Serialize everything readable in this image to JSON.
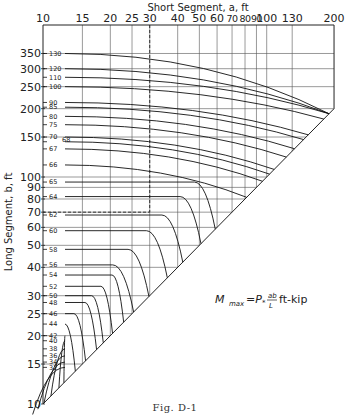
{
  "chart_data": {
    "type": "line",
    "title": "Short Segment, a, ft",
    "xlabel": "Short Segment, a, ft",
    "ylabel": "Long Segment, b, ft",
    "x_scale": "log",
    "y_scale": "log",
    "x_ticks": [
      10,
      15,
      20,
      25,
      30,
      40,
      50,
      60,
      70,
      80,
      90,
      100,
      130,
      200
    ],
    "y_ticks": [
      10,
      15,
      20,
      25,
      30,
      40,
      50,
      60,
      70,
      80,
      90,
      100,
      150,
      200,
      250,
      300,
      350
    ],
    "xlim": [
      10,
      200
    ],
    "ylim": [
      10,
      450
    ],
    "grid": true,
    "reference_lines": [
      {
        "type": "dashed-vertical",
        "a": 30
      },
      {
        "type": "dashed-horizontal",
        "b": 70
      }
    ],
    "boundary": "diagonal a = b",
    "series_label": "Contours of P* (constant moment factor)",
    "series": [
      {
        "name": "130",
        "b_at_left": 350
      },
      {
        "name": "120",
        "b_at_left": 300
      },
      {
        "name": "110",
        "b_at_left": 275
      },
      {
        "name": "100",
        "b_at_left": 250
      },
      {
        "name": "90",
        "b_at_left": 213
      },
      {
        "name": "85",
        "b_at_left": 203
      },
      {
        "name": "80",
        "b_at_left": 185
      },
      {
        "name": "75",
        "b_at_left": 170
      },
      {
        "name": "70",
        "b_at_left": 150
      },
      {
        "name": "68",
        "b_at_left": 143
      },
      {
        "name": "67",
        "b_at_left": 133
      },
      {
        "name": "66",
        "b_at_left": 113
      },
      {
        "name": "65",
        "b_at_left": 95
      },
      {
        "name": "64",
        "b_at_left": 82
      },
      {
        "name": "62",
        "b_at_left": 68
      },
      {
        "name": "60",
        "b_at_left": 58
      },
      {
        "name": "58",
        "b_at_left": 48
      },
      {
        "name": "56",
        "b_at_left": 41
      },
      {
        "name": "54",
        "b_at_left": 37
      },
      {
        "name": "52",
        "b_at_left": 33
      },
      {
        "name": "50",
        "b_at_left": 30
      },
      {
        "name": "48",
        "b_at_left": 28
      },
      {
        "name": "46",
        "b_at_left": 25
      },
      {
        "name": "44",
        "b_at_left": 22.5
      },
      {
        "name": "42",
        "b_at_left": 20
      },
      {
        "name": "40",
        "b_at_left": 19
      },
      {
        "name": "38",
        "b_at_left": 17.5
      },
      {
        "name": "36",
        "b_at_left": 16.3
      },
      {
        "name": "34",
        "b_at_left": 15.3
      },
      {
        "name": "32",
        "b_at_left": 14.5
      }
    ],
    "annotation": "M_max = P* ab/L ft-kip",
    "caption": "Fig. D-1"
  },
  "labels": {
    "x_title": "Short Segment, a, ft",
    "y_title": "Long Segment, b, ft",
    "formula_m": "M",
    "formula_sub": "max",
    "formula_eq": "=P",
    "formula_star": "*",
    "formula_num": "ab",
    "formula_den": "L",
    "formula_unit": "ft-kip",
    "caption": "Fig. D-1"
  }
}
